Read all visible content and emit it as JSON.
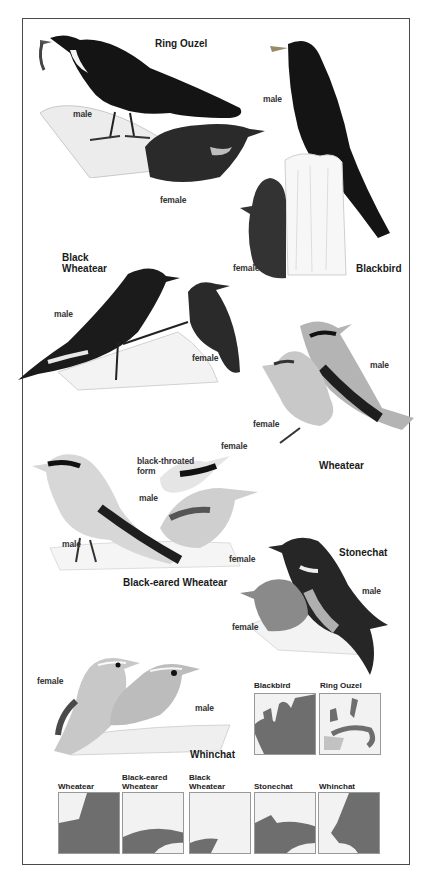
{
  "plate": {
    "species": [
      {
        "name": "Ring Ouzel",
        "labels": [
          "male",
          "female"
        ]
      },
      {
        "name": "Blackbird",
        "labels": [
          "male",
          "female"
        ]
      },
      {
        "name": "Black\nWheatear",
        "labels": [
          "male",
          "female"
        ]
      },
      {
        "name": "Wheatear",
        "labels": [
          "male",
          "female"
        ]
      },
      {
        "name": "Black-eared Wheatear",
        "labels": [
          "male",
          "female",
          "black-throated form",
          "male",
          "female"
        ]
      },
      {
        "name": "Stonechat",
        "labels": [
          "male",
          "female"
        ]
      },
      {
        "name": "Whinchat",
        "labels": [
          "male",
          "female"
        ]
      }
    ]
  },
  "labels": {
    "ring_ouzel_title": "Ring Ouzel",
    "ring_ouzel_male": "male",
    "ring_ouzel_female": "female",
    "blackbird_title": "Blackbird",
    "blackbird_male": "male",
    "blackbird_female": "female",
    "black_wheatear_title": "Black\nWheatear",
    "black_wheatear_male": "male",
    "black_wheatear_female": "female",
    "wheatear_title": "Wheatear",
    "wheatear_male": "male",
    "wheatear_female": "female",
    "bew_title": "Black-eared Wheatear",
    "bew_male": "male",
    "bew_female": "female",
    "bew_bt_form": "black-throated\nform",
    "bew_bt_male": "male",
    "bew_bt_female": "female",
    "stonechat_title": "Stonechat",
    "stonechat_male": "male",
    "stonechat_female": "female",
    "whinchat_title": "Whinchat",
    "whinchat_male": "male",
    "whinchat_female": "female"
  },
  "maps": [
    {
      "label": "Blackbird",
      "coverage": "full"
    },
    {
      "label": "Ring Ouzel",
      "coverage": "sparse"
    },
    {
      "label": "Wheatear",
      "coverage": "full"
    },
    {
      "label": "Black-eared\nWheatear",
      "coverage": "south"
    },
    {
      "label": "Black\nWheatear",
      "coverage": "iberia"
    },
    {
      "label": "Stonechat",
      "coverage": "west-south"
    },
    {
      "label": "Whinchat",
      "coverage": "north-east"
    }
  ],
  "colors": {
    "frame": "#4a4a4a",
    "range_fill": "#6e6e6e",
    "map_bg": "#f2f2f2",
    "bird_dark": "#141414"
  }
}
